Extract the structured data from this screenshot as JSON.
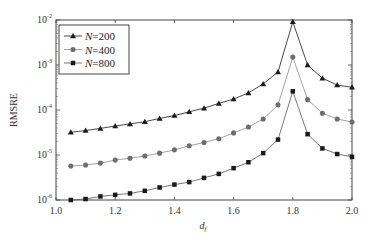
{
  "chart_data": {
    "type": "line",
    "title": "",
    "xlabel": "d_f",
    "ylabel": "RMSRE",
    "xscale": "linear",
    "yscale": "log",
    "xlim": [
      1.0,
      2.0
    ],
    "ylim": [
      1e-06,
      0.01
    ],
    "xticks": [
      1.0,
      1.2,
      1.4,
      1.6,
      1.8,
      2.0
    ],
    "xtick_labels": [
      "1.0",
      "1.2",
      "1.4",
      "1.6",
      "1.8",
      "2.0"
    ],
    "yticks": [
      1e-06,
      1e-05,
      0.0001,
      0.001,
      0.01
    ],
    "ytick_labels": [
      {
        "base": "10",
        "exp": "-6"
      },
      {
        "base": "10",
        "exp": "-5"
      },
      {
        "base": "10",
        "exp": "-4"
      },
      {
        "base": "10",
        "exp": "-3"
      },
      {
        "base": "10",
        "exp": "-2"
      }
    ],
    "grid": false,
    "legend_position": "upper left",
    "x": [
      1.05,
      1.1,
      1.15,
      1.2,
      1.25,
      1.3,
      1.35,
      1.4,
      1.45,
      1.5,
      1.55,
      1.6,
      1.65,
      1.7,
      1.75,
      1.8,
      1.85,
      1.9,
      1.95,
      2.0
    ],
    "series": [
      {
        "name": "N=200",
        "label_var": "N",
        "label_val": "=200",
        "marker": "triangle",
        "color": "#1a1a1a",
        "line_color": "#1a1a1a",
        "values": [
          3.2e-05,
          3.5e-05,
          3.9e-05,
          4.4e-05,
          4.9e-05,
          5.5e-05,
          6.5e-05,
          7.5e-05,
          9.1e-05,
          0.00011,
          0.00014,
          0.000175,
          0.00024,
          0.00038,
          0.0007,
          0.0091,
          0.001,
          0.00051,
          0.00036,
          0.00032
        ]
      },
      {
        "name": "N=400",
        "label_var": "N",
        "label_val": "=400",
        "marker": "circle",
        "color": "#6e6e6e",
        "line_color": "#8a8a8a",
        "values": [
          5.7e-06,
          6e-06,
          6.6e-06,
          7.7e-06,
          8.5e-06,
          9.5e-06,
          1.1e-05,
          1.3e-05,
          1.6e-05,
          1.9e-05,
          2.3e-05,
          3.1e-05,
          4.2e-05,
          6.3e-05,
          0.00013,
          0.0015,
          0.00017,
          8.5e-05,
          6.3e-05,
          5.4e-05
        ]
      },
      {
        "name": "N=800",
        "label_var": "N",
        "label_val": "=800",
        "marker": "square",
        "color": "#1a1a1a",
        "line_color": "#555555",
        "values": [
          1e-06,
          1.05e-06,
          1.2e-06,
          1.3e-06,
          1.4e-06,
          1.6e-06,
          1.9e-06,
          2.2e-06,
          2.5e-06,
          3.1e-06,
          3.8e-06,
          5.1e-06,
          6.9e-06,
          1.1e-05,
          2.2e-05,
          0.00026,
          2.9e-05,
          1.4e-05,
          1.05e-05,
          9.1e-06
        ]
      }
    ]
  },
  "axes": {
    "xlabel_main": "d",
    "xlabel_sub": "f",
    "ylabel": "RMSRE"
  }
}
